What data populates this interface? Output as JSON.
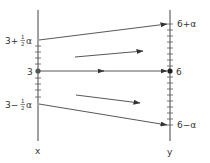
{
  "diagram": {
    "colors": {
      "background": "#ffffff",
      "ink": "#333333",
      "line": "#444444"
    },
    "axes": {
      "left": {
        "name": "x",
        "label": "x",
        "ticks": [
          {
            "label_main": "3+",
            "label_frac_num": "1",
            "label_frac_den": "2",
            "label_tail": "α",
            "y": 40
          },
          {
            "label_main": "3",
            "y": 71
          },
          {
            "label_main": "3−",
            "label_frac_num": "1",
            "label_frac_den": "2",
            "label_tail": "α",
            "y": 104
          }
        ]
      },
      "right": {
        "name": "y",
        "label": "y",
        "ticks": [
          {
            "label": "6+α",
            "y": 24
          },
          {
            "label": "6",
            "y": 71
          },
          {
            "label": "6−α",
            "y": 125
          }
        ]
      }
    },
    "arrows": [
      {
        "name": "mapping-top",
        "from": "3+½α",
        "to": "6+α"
      },
      {
        "name": "mapping-middle",
        "from": "3",
        "to": "6"
      },
      {
        "name": "mapping-bottom",
        "from": "3−½α",
        "to": "6−α"
      },
      {
        "name": "flow-upper",
        "direction": "diverging-up"
      },
      {
        "name": "flow-lower",
        "direction": "diverging-down"
      }
    ]
  }
}
